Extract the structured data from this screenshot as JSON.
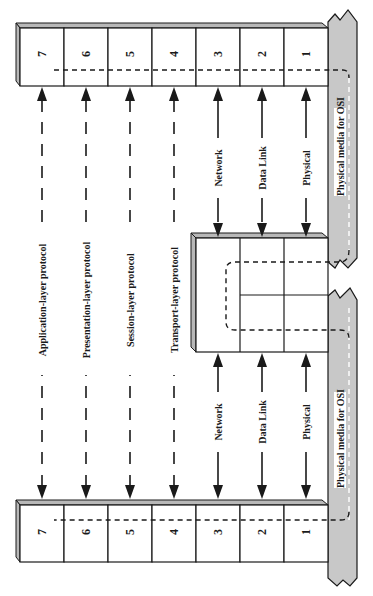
{
  "diagram": {
    "end_system_a": {
      "layers": [
        "7",
        "6",
        "5",
        "4",
        "3",
        "2",
        "1"
      ]
    },
    "end_system_b": {
      "layers": [
        "7",
        "6",
        "5",
        "4",
        "3",
        "2",
        "1"
      ]
    },
    "intermediate_node": {
      "layers": [
        "3",
        "2",
        "1"
      ]
    },
    "peer_protocols": [
      {
        "layer": "7",
        "label": "Application-layer protocol"
      },
      {
        "layer": "6",
        "label": "Presentation-layer protocol"
      },
      {
        "layer": "5",
        "label": "Session-layer protocol"
      },
      {
        "layer": "4",
        "label": "Transport-layer protocol"
      }
    ],
    "hop_protocols": [
      {
        "layer": "3",
        "label": "Network"
      },
      {
        "layer": "2",
        "label": "Data Link"
      },
      {
        "layer": "1",
        "label": "Physical"
      }
    ],
    "media": [
      {
        "label": "Physical media for OSI"
      },
      {
        "label": "Physical media for OSI"
      }
    ],
    "colors": {
      "media_fill": "#c8c8c8",
      "bevel_fill": "#b8b8b8",
      "stroke": "#1a1a1a",
      "background": "#ffffff"
    }
  }
}
